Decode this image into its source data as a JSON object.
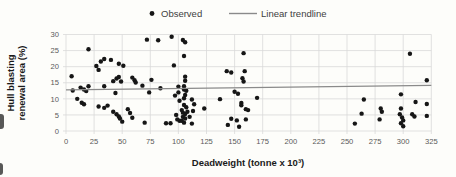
{
  "legend": {
    "observed_label": "Observed",
    "trendline_label": "Linear trendline"
  },
  "chart_data": {
    "type": "scatter",
    "title": "",
    "xlabel": "Deadweight (tonne x 10³)",
    "ylabel": "Hull blasting renewal area (%)",
    "ylabel_lines": [
      "Hull blasting",
      "renewal area (%)"
    ],
    "xlim": [
      0,
      325
    ],
    "ylim": [
      0,
      30
    ],
    "xticks": [
      0,
      25,
      50,
      75,
      100,
      125,
      150,
      175,
      200,
      225,
      250,
      275,
      300,
      325
    ],
    "yticks": [
      0,
      5,
      10,
      15,
      20,
      25,
      30
    ],
    "grid": true,
    "legend_position": "top-center",
    "colors": {
      "points": "#161616",
      "trendline": "#8a8a8a",
      "gridlines": "#d9d9d9",
      "tick_text": "#595959",
      "title_text": "#1a1a1a",
      "background": "#fdfdfa"
    },
    "series": [
      {
        "name": "Observed",
        "type": "scatter",
        "marker": "circle",
        "color": "#161616",
        "points": [
          [
            5,
            17
          ],
          [
            6,
            12.6
          ],
          [
            13,
            13.5
          ],
          [
            16,
            12.9
          ],
          [
            18,
            12.4
          ],
          [
            20,
            13.9
          ],
          [
            10,
            10
          ],
          [
            14,
            8.8
          ],
          [
            16,
            8.3
          ],
          [
            20,
            25.4
          ],
          [
            27,
            20.2
          ],
          [
            29,
            19
          ],
          [
            31,
            21.6
          ],
          [
            34,
            22.4
          ],
          [
            34,
            13.9
          ],
          [
            29,
            7.6
          ],
          [
            34,
            7.2
          ],
          [
            37,
            7.9
          ],
          [
            40,
            22.1
          ],
          [
            42,
            15.5
          ],
          [
            45,
            16.3
          ],
          [
            47,
            16.8
          ],
          [
            49,
            15.4
          ],
          [
            44,
            11.8
          ],
          [
            42,
            6
          ],
          [
            45,
            5.2
          ],
          [
            47,
            4.5
          ],
          [
            48,
            3.9
          ],
          [
            50,
            2.9
          ],
          [
            47,
            20.9
          ],
          [
            51,
            20.3
          ],
          [
            55,
            6.8
          ],
          [
            57,
            5.6
          ],
          [
            59,
            4.1
          ],
          [
            59,
            16.6
          ],
          [
            61,
            15.8
          ],
          [
            62,
            15.1
          ],
          [
            68,
            14.1
          ],
          [
            74,
            12
          ],
          [
            76,
            15.9
          ],
          [
            84,
            13.3
          ],
          [
            72,
            28.4
          ],
          [
            82,
            28.2
          ],
          [
            70,
            2.6
          ],
          [
            89,
            2.4
          ],
          [
            93,
            2.4
          ],
          [
            94,
            29.3
          ],
          [
            96,
            20.4
          ],
          [
            98,
            5
          ],
          [
            99,
            3.6
          ],
          [
            101,
            3.2
          ],
          [
            100,
            13.8
          ],
          [
            101,
            9.4
          ],
          [
            100,
            12
          ],
          [
            97,
            11
          ],
          [
            104,
            28.3
          ],
          [
            106,
            27.6
          ],
          [
            105,
            23.3
          ],
          [
            106,
            16.9
          ],
          [
            106,
            15.6
          ],
          [
            105,
            13.9
          ],
          [
            105,
            12.9
          ],
          [
            107,
            12.5
          ],
          [
            106,
            11.2
          ],
          [
            105,
            10.2
          ],
          [
            105,
            8.1
          ],
          [
            107,
            7.4
          ],
          [
            103,
            6.5
          ],
          [
            104,
            5.7
          ],
          [
            108,
            6
          ],
          [
            106,
            5.3
          ],
          [
            104,
            4.4
          ],
          [
            106,
            3.9
          ],
          [
            103,
            3.2
          ],
          [
            105,
            2.6
          ],
          [
            110,
            4.4
          ],
          [
            112,
            2.3
          ],
          [
            112,
            9.8
          ],
          [
            114,
            8.3
          ],
          [
            113,
            6.2
          ],
          [
            123,
            7
          ],
          [
            137,
            9.9
          ],
          [
            143,
            18.6
          ],
          [
            147,
            18.2
          ],
          [
            150,
            12.2
          ],
          [
            153,
            11.6
          ],
          [
            157,
            16.4
          ],
          [
            158,
            15.4
          ],
          [
            158,
            24.2
          ],
          [
            159,
            18.6
          ],
          [
            156,
            8.7
          ],
          [
            156,
            8
          ],
          [
            160,
            6.8
          ],
          [
            162,
            6.5
          ],
          [
            147,
            3.8
          ],
          [
            152,
            3.3
          ],
          [
            160,
            3.6
          ],
          [
            144,
            1.9
          ],
          [
            154,
            1.3
          ],
          [
            170,
            10.3
          ],
          [
            257,
            2.3
          ],
          [
            263,
            5.4
          ],
          [
            265,
            9.8
          ],
          [
            280,
            7
          ],
          [
            281,
            6
          ],
          [
            279,
            3.6
          ],
          [
            306,
            24
          ],
          [
            321,
            15.8
          ],
          [
            298,
            11.4
          ],
          [
            311,
            9
          ],
          [
            321,
            8.4
          ],
          [
            298,
            7
          ],
          [
            308,
            5.2
          ],
          [
            310,
            4.5
          ],
          [
            321,
            4.7
          ],
          [
            297,
            5.2
          ],
          [
            299,
            4.2
          ],
          [
            300,
            3.3
          ],
          [
            298,
            2.4
          ],
          [
            300,
            1.5
          ]
        ]
      },
      {
        "name": "Linear trendline",
        "type": "line",
        "color": "#8a8a8a",
        "points": [
          [
            0,
            12.8
          ],
          [
            325,
            14.2
          ]
        ]
      }
    ]
  }
}
